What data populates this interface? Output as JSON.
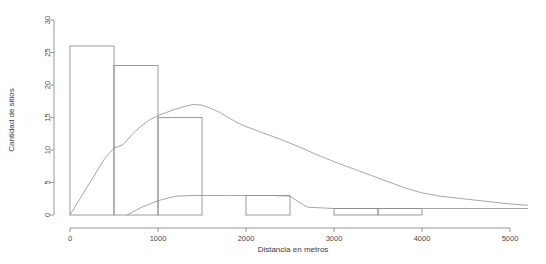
{
  "chart_data": {
    "type": "bar",
    "title": "",
    "subtitle": "",
    "xlabel": "Distancia en metros",
    "ylabel": "Cantidad de sitios",
    "xlim": [
      0,
      5200
    ],
    "ylim": [
      0,
      30
    ],
    "grid": false,
    "legend": "none",
    "xticks": [
      0,
      1000,
      2000,
      3000,
      4000,
      5000
    ],
    "xtick_labels": [
      "0",
      "1000",
      "2000",
      "3000",
      "4000",
      "5000"
    ],
    "yticks": [
      0,
      5,
      10,
      15,
      20,
      25,
      30
    ],
    "ytick_labels": [
      "0",
      "5",
      "10",
      "15",
      "20",
      "25",
      "30"
    ],
    "bin_width": 500,
    "bins": [
      {
        "x0": 0,
        "x1": 500,
        "value": 26
      },
      {
        "x0": 500,
        "x1": 1000,
        "value": 23
      },
      {
        "x0": 1000,
        "x1": 1500,
        "value": 15
      },
      {
        "x0": 1500,
        "x1": 2000,
        "value": 0
      },
      {
        "x0": 2000,
        "x1": 2500,
        "value": 3
      },
      {
        "x0": 2500,
        "x1": 3000,
        "value": 0
      },
      {
        "x0": 3000,
        "x1": 3500,
        "value": 1
      },
      {
        "x0": 3500,
        "x1": 4000,
        "value": 1
      }
    ],
    "series": [
      {
        "name": "densidad-principal",
        "type": "line",
        "x": [
          0,
          100,
          200,
          300,
          400,
          500,
          600,
          700,
          800,
          900,
          1000,
          1100,
          1200,
          1300,
          1400,
          1500,
          1600,
          1700,
          1800,
          1900,
          2000,
          2200,
          2400,
          2600,
          2800,
          3000,
          3200,
          3400,
          3600,
          3800,
          4000,
          4200,
          4400,
          4600,
          4800,
          5000,
          5200
        ],
        "values": [
          0,
          2.2,
          4.4,
          6.6,
          8.8,
          10.3,
          10.8,
          12.3,
          13.6,
          14.6,
          15.3,
          15.8,
          16.3,
          16.7,
          17.0,
          16.9,
          16.4,
          15.8,
          15.0,
          14.2,
          13.6,
          12.6,
          11.6,
          10.5,
          9.3,
          8.2,
          7.2,
          6.2,
          5.2,
          4.2,
          3.4,
          2.9,
          2.6,
          2.3,
          2.0,
          1.7,
          1.5
        ]
      },
      {
        "name": "densidad-secundaria",
        "type": "line",
        "x": [
          650,
          800,
          1000,
          1200,
          1400,
          1500,
          1800,
          2100,
          2300,
          2500,
          2600,
          2700,
          3000,
          3500,
          4000,
          5200
        ],
        "values": [
          0,
          1.1,
          2.2,
          2.9,
          3.0,
          3.0,
          3.0,
          3.0,
          3.0,
          2.9,
          2.0,
          1.2,
          1.0,
          1.0,
          1.0,
          1.0
        ]
      }
    ]
  },
  "axes": {
    "x_title": "Distancia en metros",
    "y_title": "Cantidad de sitios"
  }
}
